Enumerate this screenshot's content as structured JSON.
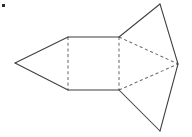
{
  "figure": {
    "canvas": {
      "width": 192,
      "height": 137,
      "background": "#ffffff"
    },
    "style": {
      "solid_line_color": "#3f3f44",
      "dashed_line_color": "#6d6d73",
      "face_fill_color": "#ffffff",
      "line_width": 1.05,
      "dash_pattern": "3.1 2.6"
    },
    "vertices": {
      "left_apex": [
        15,
        63
      ],
      "rect_top_left": [
        68,
        37
      ],
      "rect_top_right": [
        119,
        37
      ],
      "rect_bottom_right": [
        119,
        90
      ],
      "rect_bottom_left": [
        68,
        90
      ],
      "upper_flap_apex": [
        160,
        4
      ],
      "right_apex": [
        178,
        64
      ],
      "lower_flap_apex": [
        160,
        131
      ]
    },
    "faces": [
      {
        "name": "left-triangle-face",
        "points": "15,63 68,37 68,90",
        "kind": "triangle"
      },
      {
        "name": "center-rectangle-face",
        "points": "68,37 119,37 119,90 68,90",
        "kind": "rectangle"
      },
      {
        "name": "upper-right-triangle-face",
        "points": "119,37 160,4 178,64",
        "kind": "triangle"
      },
      {
        "name": "lower-right-triangle-face",
        "points": "119,90 160,131 178,64",
        "kind": "triangle"
      }
    ],
    "solid_edges": [
      {
        "name": "left-upper-slant-edge",
        "d": "M 15,63 L 68,37"
      },
      {
        "name": "left-lower-slant-edge",
        "d": "M 15,63 L 68,90"
      },
      {
        "name": "rectangle-top-edge",
        "d": "M 68,37 L 119,37"
      },
      {
        "name": "rectangle-bottom-edge",
        "d": "M 68,90 L 119,90"
      },
      {
        "name": "upper-flap-left-edge",
        "d": "M 119,37 L 160,4"
      },
      {
        "name": "upper-flap-right-edge",
        "d": "M 160,4 L 178,64"
      },
      {
        "name": "lower-flap-left-edge",
        "d": "M 119,90 L 160,131"
      },
      {
        "name": "lower-flap-right-edge",
        "d": "M 160,131 L 178,64"
      }
    ],
    "dashed_edges": [
      {
        "name": "left-fold-line",
        "d": "M 68,37 L 68,90"
      },
      {
        "name": "right-fold-line",
        "d": "M 119,37 L 119,90"
      },
      {
        "name": "upper-hidden-diagonal",
        "d": "M 119,37 L 178,64"
      },
      {
        "name": "lower-hidden-diagonal",
        "d": "M 119,90 L 178,64"
      }
    ],
    "corner_mark": {
      "name": "top-left-corner-mark",
      "x": 2,
      "y": 4,
      "width": 3,
      "height": 3,
      "color": "#2b2b2f"
    }
  }
}
